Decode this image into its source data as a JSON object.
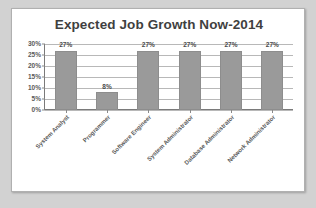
{
  "chart_data": {
    "type": "bar",
    "title": "Expected Job Growth Now-2014",
    "categories": [
      "System Analyst",
      "Programmer",
      "Software Engineer",
      "System Administrator",
      "Database Administrator",
      "Network Administrator"
    ],
    "values": [
      27,
      8,
      27,
      27,
      27,
      27
    ],
    "data_labels": [
      "27%",
      "8%",
      "27%",
      "27%",
      "27%",
      "27%"
    ],
    "xlabel": "",
    "ylabel": "",
    "ylim": [
      0,
      30
    ],
    "ytick_values": [
      0,
      5,
      10,
      15,
      20,
      25,
      30
    ],
    "ytick_labels": [
      "0%",
      "5%",
      "10%",
      "15%",
      "20%",
      "25%",
      "30%"
    ],
    "grid": true,
    "grid_axis": "y",
    "legend": false,
    "legend_position": "none",
    "bar_color": "#9a9a9a",
    "gridline_color": "#b8b8b8",
    "axis_color": "#7a7a7a",
    "title_color": "#3f3f3f",
    "label_color": "#5a5a5a",
    "panel_background": "#ffffff",
    "outer_background": "#d2d2d2"
  }
}
